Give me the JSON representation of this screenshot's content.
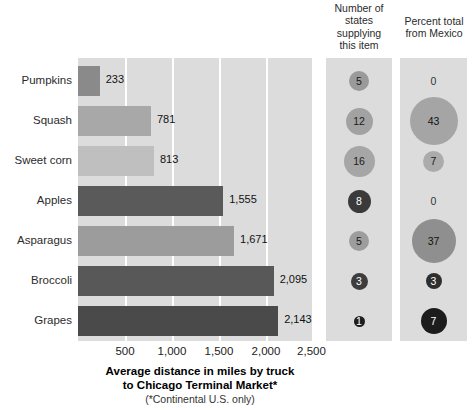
{
  "headers": {
    "states": "Number of\nstates\nsupplying\nthis item",
    "mexico": "Percent total\nfrom Mexico"
  },
  "axis": {
    "caption_line1": "Average distance in miles by truck",
    "caption_line2": "to Chicago Terminal Market*",
    "note": "(*Continental U.S. only)",
    "ticks": [
      "500",
      "1,000",
      "1,500",
      "2,000",
      "2,500"
    ]
  },
  "chart_data": {
    "type": "bar",
    "title": "Average distance in miles by truck to Chicago Terminal Market*",
    "subtitle": "(*Continental U.S. only)",
    "xlabel": "Average distance in miles by truck to Chicago Terminal Market*",
    "ylabel": "",
    "xlim": [
      0,
      2500
    ],
    "xticks": [
      500,
      1000,
      1500,
      2000,
      2500
    ],
    "xticklabels": [
      "500",
      "1,000",
      "1,500",
      "2,000",
      "2,500"
    ],
    "grid": true,
    "orientation": "horizontal",
    "legend": "none",
    "categories": [
      "Pumpkins",
      "Squash",
      "Sweet corn",
      "Apples",
      "Asparagus",
      "Broccoli",
      "Grapes"
    ],
    "values": [
      233,
      781,
      813,
      1555,
      1671,
      2095,
      2143
    ],
    "value_labels": [
      "233",
      "781",
      "813",
      "1,555",
      "1,671",
      "2,095",
      "2,143"
    ],
    "bar_colors": [
      "#8a8a8a",
      "#a8a8a8",
      "#bfbfbf",
      "#5a5a5a",
      "#9c9c9c",
      "#585858",
      "#4a4a4a"
    ],
    "panels": [
      {
        "name": "number-of-states",
        "type": "bubble",
        "title": "Number of states supplying this item",
        "categories": [
          "Pumpkins",
          "Squash",
          "Sweet corn",
          "Apples",
          "Asparagus",
          "Broccoli",
          "Grapes"
        ],
        "values": [
          5,
          12,
          16,
          8,
          5,
          3,
          1
        ],
        "labels": [
          "5",
          "12",
          "16",
          "8",
          "5",
          "3",
          "1"
        ]
      },
      {
        "name": "percent-total-from-mexico",
        "type": "bubble",
        "title": "Percent total from Mexico",
        "categories": [
          "Pumpkins",
          "Squash",
          "Sweet corn",
          "Apples",
          "Asparagus",
          "Broccoli",
          "Grapes"
        ],
        "values": [
          0,
          43,
          7,
          0,
          37,
          3,
          7
        ],
        "labels": [
          "0",
          "43",
          "7",
          "0",
          "37",
          "3",
          "7"
        ]
      }
    ]
  },
  "rows": [
    {
      "category": "Pumpkins",
      "distance_label": "233",
      "distance": 233,
      "bar_color": "#8a8a8a",
      "states_label": "5",
      "states": 5,
      "states_size": 20,
      "states_fill": "#9a9a9a",
      "states_text": "#1a1a1a",
      "mexico_label": "0",
      "mexico": 0,
      "mexico_size": 0,
      "mexico_fill": "transparent",
      "mexico_text": "#333333"
    },
    {
      "category": "Squash",
      "distance_label": "781",
      "distance": 781,
      "bar_color": "#a8a8a8",
      "states_label": "12",
      "states": 12,
      "states_size": 27,
      "states_fill": "#a2a2a2",
      "states_text": "#1a1a1a",
      "mexico_label": "43",
      "mexico": 43,
      "mexico_size": 48,
      "mexico_fill": "#a5a5a5",
      "mexico_text": "#111111"
    },
    {
      "category": "Sweet corn",
      "distance_label": "813",
      "distance": 813,
      "bar_color": "#bfbfbf",
      "states_label": "16",
      "states": 16,
      "states_size": 31,
      "states_fill": "#a6a6a6",
      "states_text": "#1a1a1a",
      "mexico_label": "7",
      "mexico": 7,
      "mexico_size": 21,
      "mexico_fill": "#ababab",
      "mexico_text": "#1a1a1a"
    },
    {
      "category": "Apples",
      "distance_label": "1,555",
      "distance": 1555,
      "bar_color": "#5a5a5a",
      "states_label": "8",
      "states": 8,
      "states_size": 23,
      "states_fill": "#3a3a3a",
      "states_text": "#ffffff",
      "mexico_label": "0",
      "mexico": 0,
      "mexico_size": 0,
      "mexico_fill": "transparent",
      "mexico_text": "#333333"
    },
    {
      "category": "Asparagus",
      "distance_label": "1,671",
      "distance": 1671,
      "bar_color": "#9c9c9c",
      "states_label": "5",
      "states": 5,
      "states_size": 20,
      "states_fill": "#9d9d9d",
      "states_text": "#1a1a1a",
      "mexico_label": "37",
      "mexico": 37,
      "mexico_size": 44,
      "mexico_fill": "#8f8f8f",
      "mexico_text": "#111111"
    },
    {
      "category": "Broccoli",
      "distance_label": "2,095",
      "distance": 2095,
      "bar_color": "#585858",
      "states_label": "3",
      "states": 3,
      "states_size": 17,
      "states_fill": "#3d3d3d",
      "states_text": "#ffffff",
      "mexico_label": "3",
      "mexico": 3,
      "mexico_size": 16,
      "mexico_fill": "#2e2e2e",
      "mexico_text": "#ffffff"
    },
    {
      "category": "Grapes",
      "distance_label": "2,143",
      "distance": 2143,
      "bar_color": "#4a4a4a",
      "states_label": "1",
      "states": 1,
      "states_size": 11,
      "states_fill": "#1e1e1e",
      "states_text": "#ffffff",
      "mexico_label": "7",
      "mexico": 7,
      "mexico_size": 26,
      "mexico_fill": "#1c1c1c",
      "mexico_text": "#ffffff"
    }
  ]
}
